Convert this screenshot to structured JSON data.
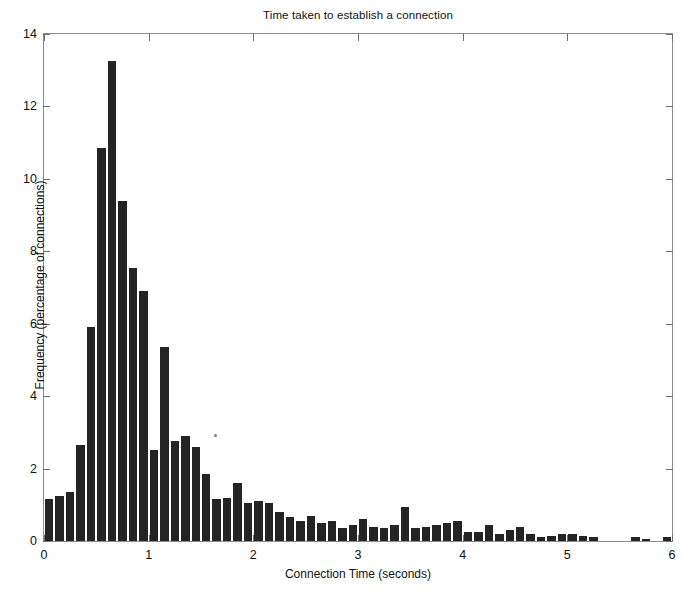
{
  "chart_data": {
    "type": "bar",
    "title": "Time taken to establish a connection",
    "xlabel": "Connection Time (seconds)",
    "ylabel": "Frequency (percentage of connections)",
    "xlim": [
      0,
      6
    ],
    "ylim": [
      0,
      14
    ],
    "xticks": [
      0,
      1,
      2,
      3,
      4,
      5,
      6
    ],
    "xtick_labels": [
      "0",
      "1",
      "2",
      "3",
      "4",
      "5",
      "6"
    ],
    "yticks": [
      0,
      2,
      4,
      6,
      8,
      10,
      12,
      14
    ],
    "ytick_labels": [
      "0",
      "2",
      "4",
      "6",
      "8",
      "10",
      "12",
      "14"
    ],
    "grid": false,
    "legend": null,
    "bar_color": "#242424",
    "frame_color": "#8c8c8c",
    "bin_width": 0.1,
    "categories": [
      "0.0-0.1",
      "0.1-0.2",
      "0.2-0.3",
      "0.3-0.4",
      "0.4-0.5",
      "0.5-0.6",
      "0.6-0.7",
      "0.7-0.8",
      "0.8-0.9",
      "0.9-1.0",
      "1.0-1.1",
      "1.1-1.2",
      "1.2-1.3",
      "1.3-1.4",
      "1.4-1.5",
      "1.5-1.6",
      "1.6-1.7",
      "1.7-1.8",
      "1.8-1.9",
      "1.9-2.0",
      "2.0-2.1",
      "2.1-2.2",
      "2.2-2.3",
      "2.3-2.4",
      "2.4-2.5",
      "2.5-2.6",
      "2.6-2.7",
      "2.7-2.8",
      "2.8-2.9",
      "2.9-3.0",
      "3.0-3.1",
      "3.1-3.2",
      "3.2-3.3",
      "3.3-3.4",
      "3.4-3.5",
      "3.5-3.6",
      "3.6-3.7",
      "3.7-3.8",
      "3.8-3.9",
      "3.9-4.0",
      "4.0-4.1",
      "4.1-4.2",
      "4.2-4.3",
      "4.3-4.4",
      "4.4-4.5",
      "4.5-4.6",
      "4.6-4.7",
      "4.7-4.8",
      "4.8-4.9",
      "4.9-5.0",
      "5.0-5.1",
      "5.1-5.2",
      "5.2-5.3",
      "5.3-5.4",
      "5.4-5.5",
      "5.5-5.6",
      "5.6-5.7",
      "5.7-5.8",
      "5.8-5.9",
      "5.9-6.0"
    ],
    "x": [
      0.05,
      0.15,
      0.25,
      0.35,
      0.45,
      0.55,
      0.65,
      0.75,
      0.85,
      0.95,
      1.05,
      1.15,
      1.25,
      1.35,
      1.45,
      1.55,
      1.65,
      1.75,
      1.85,
      1.95,
      2.05,
      2.15,
      2.25,
      2.35,
      2.45,
      2.55,
      2.65,
      2.75,
      2.85,
      2.95,
      3.05,
      3.15,
      3.25,
      3.35,
      3.45,
      3.55,
      3.65,
      3.75,
      3.85,
      3.95,
      4.05,
      4.15,
      4.25,
      4.35,
      4.45,
      4.55,
      4.65,
      4.75,
      4.85,
      4.95,
      5.05,
      5.15,
      5.25,
      5.35,
      5.45,
      5.55,
      5.65,
      5.75,
      5.85,
      5.95
    ],
    "values": [
      1.15,
      1.25,
      1.35,
      2.65,
      5.9,
      10.85,
      13.25,
      9.4,
      7.55,
      6.9,
      2.5,
      5.35,
      2.75,
      2.9,
      2.6,
      1.85,
      1.15,
      1.2,
      1.6,
      1.05,
      1.1,
      1.05,
      0.8,
      0.65,
      0.55,
      0.7,
      0.5,
      0.55,
      0.35,
      0.45,
      0.6,
      0.4,
      0.35,
      0.45,
      0.95,
      0.35,
      0.4,
      0.45,
      0.5,
      0.55,
      0.25,
      0.25,
      0.45,
      0.2,
      0.3,
      0.4,
      0.2,
      0.1,
      0.15,
      0.2,
      0.2,
      0.15,
      0.1,
      0.0,
      0.0,
      0.0,
      0.1,
      0.05,
      0.0,
      0.12
    ]
  }
}
